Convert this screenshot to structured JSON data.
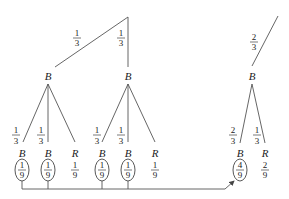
{
  "diagram": {
    "type": "probability-tree",
    "top_branches": [
      {
        "prob": {
          "num": "1",
          "den": "3"
        },
        "node": "B"
      },
      {
        "prob": {
          "num": "1",
          "den": "3"
        },
        "node": "B"
      }
    ],
    "right_branch": {
      "prob": {
        "num": "2",
        "den": "3"
      },
      "node": "B"
    },
    "left_subtree": {
      "edges": [
        {
          "num": "1",
          "den": "3"
        },
        {
          "num": "1",
          "den": "3"
        }
      ],
      "leaves": [
        {
          "node": "B",
          "num": "1",
          "den": "9",
          "circled": true
        },
        {
          "node": "B",
          "num": "1",
          "den": "9",
          "circled": true
        },
        {
          "node": "R",
          "num": "1",
          "den": "9",
          "circled": false
        }
      ]
    },
    "middle_subtree": {
      "edges": [
        {
          "num": "1",
          "den": "3"
        },
        {
          "num": "1",
          "den": "3"
        }
      ],
      "leaves": [
        {
          "node": "B",
          "num": "1",
          "den": "9",
          "circled": true
        },
        {
          "node": "B",
          "num": "1",
          "den": "9",
          "circled": true
        },
        {
          "node": "R",
          "num": "1",
          "den": "9",
          "circled": false
        }
      ]
    },
    "right_subtree": {
      "edges": [
        {
          "num": "2",
          "den": "3"
        },
        {
          "num": "1",
          "den": "3"
        }
      ],
      "leaves": [
        {
          "node": "B",
          "num": "4",
          "den": "9",
          "circled": true
        },
        {
          "node": "R",
          "num": "2",
          "den": "9",
          "circled": false
        }
      ]
    }
  }
}
